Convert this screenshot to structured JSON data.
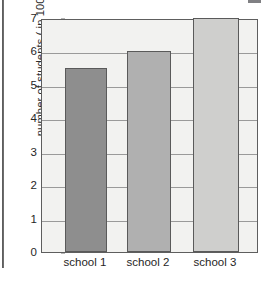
{
  "chart_data": {
    "type": "bar",
    "title": "",
    "subtitle": "",
    "xlabel": "",
    "ylabel": "number of students ( in 100s)",
    "categories": [
      "school 1",
      "school 2",
      "school 3"
    ],
    "values": [
      5.5,
      6,
      7
    ],
    "series": [
      {
        "name": "number of students",
        "values": [
          5.5,
          6,
          7
        ]
      }
    ],
    "ylim": [
      0,
      7
    ],
    "y_ticks": [
      0,
      1,
      2,
      3,
      4,
      5,
      6,
      7
    ],
    "y_tick_labels": [
      "0",
      "1",
      "2",
      "3",
      "4",
      "5",
      "6",
      "7"
    ],
    "grid": true,
    "grid_axis": "y",
    "legend": false,
    "legend_position": "none",
    "annotations": [],
    "bar_colors": [
      "#8e8e8e",
      "#b0b0b0",
      "#cfcfcd"
    ],
    "bar_edge_color": "#5a5a5a",
    "plot_background": "#f2f2f0",
    "gridline_color": "#9a9a9a",
    "axis_color": "#5e5e5e",
    "text_color": "#262626",
    "page_background": "#ffffff"
  },
  "figure": {
    "y_axis": {
      "label": "number of students ( in 100s)",
      "ticks": [
        {
          "value": 7,
          "label": "7"
        },
        {
          "value": 6,
          "label": "6"
        },
        {
          "value": 5,
          "label": "5"
        },
        {
          "value": 4,
          "label": "4"
        },
        {
          "value": 3,
          "label": "3"
        },
        {
          "value": 2,
          "label": "2"
        },
        {
          "value": 1,
          "label": "1"
        },
        {
          "value": 0,
          "label": "0"
        }
      ]
    },
    "x_axis": {
      "label": "",
      "ticks": [
        {
          "label": "school 1"
        },
        {
          "label": "school 2"
        },
        {
          "label": "school 3"
        }
      ]
    },
    "bars": [
      {
        "category": "school 1",
        "value": 5.5,
        "color": "#8e8e8e"
      },
      {
        "category": "school 2",
        "value": 6,
        "color": "#b0b0b0"
      },
      {
        "category": "school 3",
        "value": 7,
        "color": "#cfcfcd"
      }
    ]
  }
}
